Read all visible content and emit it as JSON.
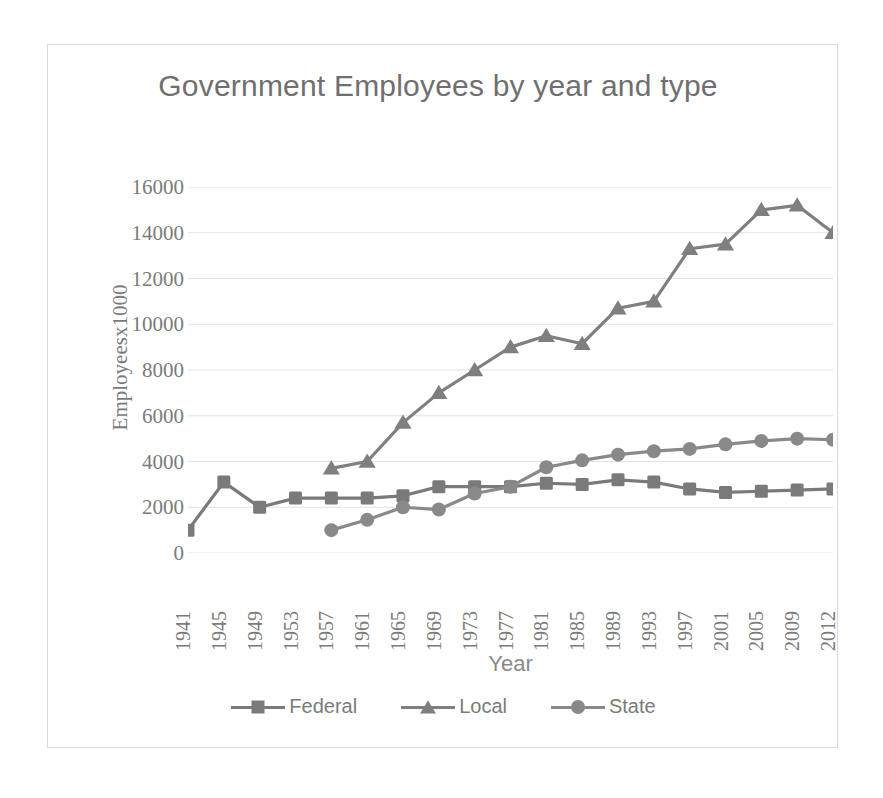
{
  "chart_data": {
    "type": "line",
    "title": "Government Employees by year and type",
    "xlabel": "Year",
    "ylabel": "Employeesx1000",
    "ylim": [
      0,
      16000
    ],
    "ytick_step": 2000,
    "yticks": [
      "16000",
      "14000",
      "12000",
      "10000",
      "8000",
      "6000",
      "4000",
      "2000",
      "0"
    ],
    "grid": true,
    "legend_position": "bottom",
    "categories": [
      "1941",
      "1945",
      "1949",
      "1953",
      "1957",
      "1961",
      "1965",
      "1969",
      "1973",
      "1977",
      "1981",
      "1985",
      "1989",
      "1993",
      "1997",
      "2001",
      "2005",
      "2009",
      "2012"
    ],
    "series": [
      {
        "name": "Federal",
        "marker": "square",
        "color": "#7a7a7a",
        "values": [
          1000,
          3100,
          2000,
          2400,
          2400,
          2400,
          2500,
          2900,
          2900,
          2900,
          3050,
          3000,
          3200,
          3100,
          2800,
          2650,
          2700,
          2750,
          2800
        ]
      },
      {
        "name": "Local",
        "marker": "triangle",
        "color": "#7f7f7f",
        "values": [
          null,
          null,
          null,
          null,
          3700,
          4000,
          5700,
          7000,
          8000,
          9000,
          9500,
          9150,
          10700,
          11000,
          13300,
          13500,
          15000,
          15200,
          14000
        ]
      },
      {
        "name": "State",
        "marker": "circle",
        "color": "#898989",
        "values": [
          null,
          null,
          null,
          null,
          1000,
          1450,
          2000,
          1900,
          2600,
          2900,
          3750,
          4050,
          4300,
          4450,
          4550,
          4750,
          4900,
          5000,
          4950
        ]
      }
    ]
  },
  "legend": {
    "entries": [
      {
        "label": "Federal"
      },
      {
        "label": "Local"
      },
      {
        "label": "State"
      }
    ]
  }
}
